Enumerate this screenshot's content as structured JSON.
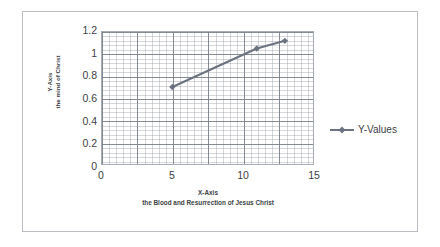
{
  "chart_data": {
    "type": "line",
    "title": "",
    "xlabel": "X-Axis\nthe Blood and Resurrection of Jesus Christ",
    "ylabel": "Y-Axis\nthe mind of Christ",
    "xlim": [
      0,
      15
    ],
    "ylim": [
      0,
      1.2
    ],
    "grid": true,
    "legend_position": "right",
    "x": [
      5,
      11,
      13
    ],
    "series": [
      {
        "name": "Y-Values",
        "values": [
          0.7,
          1.05,
          1.12
        ],
        "color": "#6b7280",
        "marker": "diamond"
      }
    ],
    "x_ticks": [
      "0",
      "5",
      "10",
      "15"
    ],
    "x_tick_values": [
      0,
      5,
      10,
      15
    ],
    "y_ticks": [
      "1.2",
      "1",
      "0.8",
      "0.6",
      "0.4",
      "0.2",
      "0"
    ],
    "y_tick_values": [
      1.2,
      1,
      0.8,
      0.6,
      0.4,
      0.2,
      0
    ]
  },
  "axes": {
    "y_title_line1": "Y-Axis",
    "y_title_line2": "the mind of Christ",
    "x_title_line1": "X-Axis",
    "x_title_line2": "the Blood and Resurrection of Jesus Christ"
  },
  "legend": {
    "entries": [
      {
        "label": "Y-Values"
      }
    ]
  },
  "colors": {
    "series": "#6b7280",
    "grid_major": "#787e86",
    "grid_minor": "#969ba2",
    "axis_text": "#3d4147",
    "frame_border": "#b9bcc0"
  }
}
